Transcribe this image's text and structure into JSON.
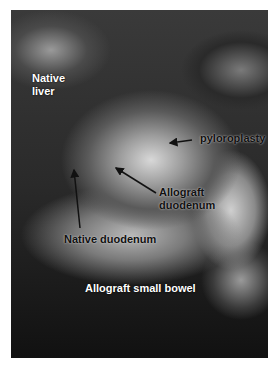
{
  "figure": {
    "labels": [
      {
        "id": "native-liver",
        "text": "Native\nliver",
        "line1": "Native",
        "line2": "liver",
        "color": "#ffffff"
      },
      {
        "id": "pyloroplasty",
        "text": "pyloroplasty",
        "color": "#111111"
      },
      {
        "id": "allograft-duodenum",
        "text": "Allograft duodenum",
        "line1": "Allograft",
        "line2": "duodenum",
        "color": "#111111"
      },
      {
        "id": "native-duodenum",
        "text": "Native duodenum",
        "color": "#111111"
      },
      {
        "id": "allograft-small-bowel",
        "text": "Allograft small bowel",
        "color": "#ffffff"
      }
    ]
  }
}
